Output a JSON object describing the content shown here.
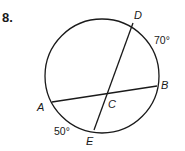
{
  "problem": {
    "number": "8."
  },
  "diagram": {
    "circle": {
      "cx": 102,
      "cy": 76,
      "r": 57
    },
    "chords": [
      {
        "name": "AB",
        "from": "A",
        "to": "B"
      },
      {
        "name": "DE",
        "from": "D",
        "to": "E"
      }
    ],
    "points": {
      "A": {
        "label": "A"
      },
      "B": {
        "label": "B"
      },
      "C": {
        "label": "C"
      },
      "D": {
        "label": "D"
      },
      "E": {
        "label": "E"
      }
    },
    "arcs": {
      "DB": {
        "measure": "70°"
      },
      "AE": {
        "measure": "50°"
      }
    }
  }
}
